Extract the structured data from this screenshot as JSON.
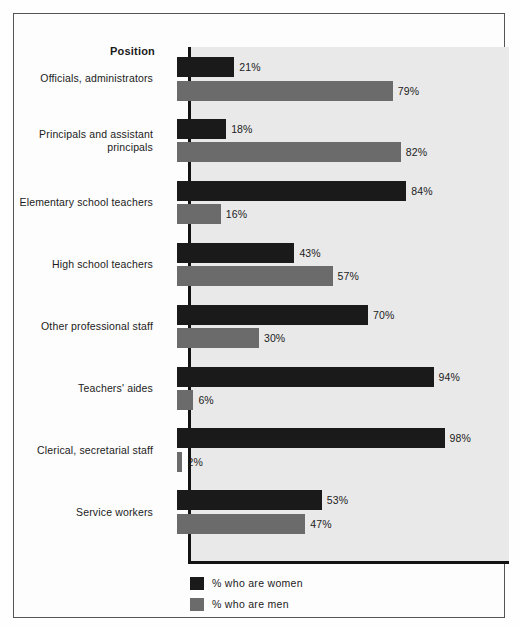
{
  "figure": {
    "axis_header": "Position",
    "background_color": "#e9e9e9",
    "frame_color": "#555555"
  },
  "legend": {
    "position": "bottom-left",
    "items": [
      {
        "label": "% who are women",
        "color": "#1a1a1a",
        "swatch_name": "legend-swatch-women"
      },
      {
        "label": "% who are men",
        "color": "#6b6b6b",
        "swatch_name": "legend-swatch-men"
      }
    ]
  },
  "chart_data": {
    "type": "bar",
    "orientation": "horizontal",
    "title": "",
    "subtitle": "",
    "xlabel": "",
    "ylabel": "Position",
    "xlim": [
      0,
      100
    ],
    "grid": false,
    "legend_position": "bottom-left",
    "categories": [
      "Officials, administrators",
      "Principals and assistant principals",
      "Elementary school teachers",
      "High school teachers",
      "Other professional staff",
      "Teachers' aides",
      "Clerical, secretarial staff",
      "Service workers"
    ],
    "series": [
      {
        "name": "% who are women",
        "color": "#1a1a1a",
        "values": [
          21,
          18,
          84,
          43,
          70,
          94,
          98,
          53
        ],
        "labels": [
          "21%",
          "18%",
          "84%",
          "43%",
          "70%",
          "94%",
          "98%",
          "53%"
        ]
      },
      {
        "name": "% who are men",
        "color": "#6b6b6b",
        "values": [
          79,
          82,
          16,
          57,
          30,
          6,
          2,
          47
        ],
        "labels": [
          "79%",
          "82%",
          "16%",
          "57%",
          "30%",
          "6%",
          "2%",
          "47%"
        ]
      }
    ]
  },
  "category_label_lines": [
    [
      "Officials, administrators"
    ],
    [
      "Principals and assistant",
      "principals"
    ],
    [
      "Elementary school teachers"
    ],
    [
      "High school teachers"
    ],
    [
      "Other professional staff"
    ],
    [
      "Teachers' aides"
    ],
    [
      "Clerical, secretarial staff"
    ],
    [
      "Service workers"
    ]
  ]
}
